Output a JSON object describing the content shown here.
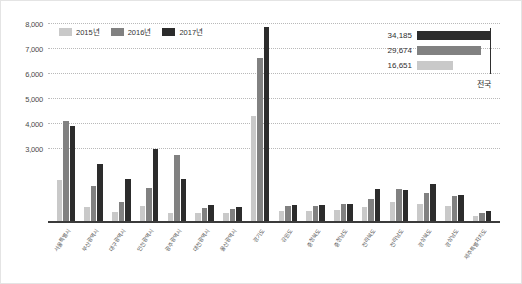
{
  "chart_data": {
    "type": "bar",
    "title": "",
    "xlabel": "",
    "ylabel": "",
    "ylim": [
      0,
      8000
    ],
    "grid": true,
    "legend_position": "top-left",
    "ytick_labels": [
      "8,000",
      "7,000",
      "6,000",
      "5,000",
      "4,000",
      "3,000"
    ],
    "yticks": [
      8000,
      7000,
      6000,
      5000,
      4000,
      3000
    ],
    "categories": [
      "서울특별시",
      "부산광역시",
      "대구광역시",
      "인천광역시",
      "광주광역시",
      "대전광역시",
      "울산광역시",
      "경기도",
      "강원도",
      "충청북도",
      "충청남도",
      "전라북도",
      "전라남도",
      "경상북도",
      "경상남도",
      "제주특별자치도"
    ],
    "series": [
      {
        "name": "2015년",
        "color": "#c9c9c9",
        "values": [
          1650,
          560,
          380,
          620,
          320,
          330,
          340,
          4250,
          400,
          420,
          460,
          560,
          760,
          700,
          620,
          200
        ]
      },
      {
        "name": "2016년",
        "color": "#818181",
        "values": [
          4050,
          1420,
          760,
          1320,
          2650,
          540,
          470,
          6600,
          620,
          610,
          680,
          880,
          1280,
          1120,
          1020,
          330
        ]
      },
      {
        "name": "2017년",
        "color": "#2c2c2c",
        "values": [
          3850,
          2300,
          1700,
          2900,
          1680,
          640,
          560,
          7820,
          640,
          640,
          700,
          1290,
          1260,
          1500,
          1060,
          400
        ]
      }
    ],
    "inset": {
      "caption": "전국",
      "rows": [
        {
          "label": "34,185",
          "value": 34185,
          "color": "#2c2c2c",
          "series": "2017년"
        },
        {
          "label": "29,674",
          "value": 29674,
          "color": "#818181",
          "series": "2016년"
        },
        {
          "label": "16,651",
          "value": 16651,
          "color": "#c9c9c9",
          "series": "2015년"
        }
      ],
      "max": 34185
    }
  }
}
